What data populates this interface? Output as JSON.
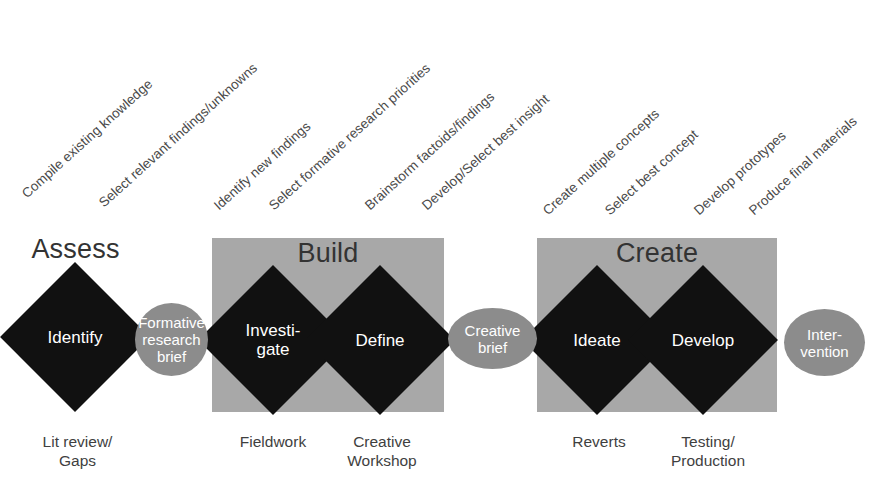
{
  "diagram": {
    "title_visible": false,
    "colors": {
      "phase_box_gray": "#a8a8a8",
      "ellipse_gray": "#8c8c8c",
      "diamond_black": "#111111",
      "text_dark": "#3a3a3a",
      "text_light": "#ffffff",
      "background": "#ffffff"
    }
  },
  "top_labels": [
    {
      "id": "compile-existing-knowledge",
      "text": "Compile existing knowledge"
    },
    {
      "id": "select-relevant-findings-unknowns",
      "text": "Select relevant findings/unknowns"
    },
    {
      "id": "identify-new-findings",
      "text": "Identify new findings"
    },
    {
      "id": "select-formative-research-priorities",
      "text": "Select formative research priorities"
    },
    {
      "id": "brainstorm-factoids-findings",
      "text": "Brainstorm factoids/findings"
    },
    {
      "id": "develop-select-best-insight",
      "text": "Develop/Select best insight"
    },
    {
      "id": "create-multiple-concepts",
      "text": "Create multiple concepts"
    },
    {
      "id": "select-best-concept",
      "text": "Select best concept"
    },
    {
      "id": "develop-prototypes",
      "text": "Develop prototypes"
    },
    {
      "id": "produce-final-materials",
      "text": "Produce final materials"
    }
  ],
  "phases": [
    {
      "id": "assess",
      "label": "Assess",
      "boxed": false
    },
    {
      "id": "build",
      "label": "Build",
      "boxed": true
    },
    {
      "id": "create",
      "label": "Create",
      "boxed": true
    }
  ],
  "stages": [
    {
      "id": "identify",
      "label": "Identify"
    },
    {
      "id": "investigate",
      "label": "Investi-\ngate"
    },
    {
      "id": "define",
      "label": "Define"
    },
    {
      "id": "ideate",
      "label": "Ideate"
    },
    {
      "id": "develop",
      "label": "Develop"
    }
  ],
  "deliverables": [
    {
      "id": "formative-research-brief",
      "label": "Formative\nresearch\nbrief"
    },
    {
      "id": "creative-brief",
      "label": "Creative\nbrief"
    },
    {
      "id": "intervention",
      "label": "Inter-\nvention"
    }
  ],
  "captions": [
    {
      "id": "lit-review-gaps",
      "text": "Lit review/\nGaps"
    },
    {
      "id": "fieldwork",
      "text": "Fieldwork"
    },
    {
      "id": "creative-workshop",
      "text": "Creative\nWorkshop"
    },
    {
      "id": "reverts",
      "text": "Reverts"
    },
    {
      "id": "testing-production",
      "text": "Testing/\nProduction"
    }
  ]
}
